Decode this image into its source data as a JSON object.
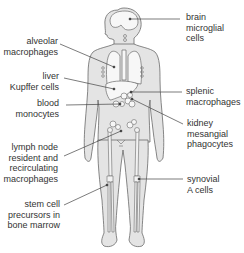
{
  "diagram": {
    "title": "",
    "colors": {
      "body_fill": "#e4e4e4",
      "outline": "#6a6a6a",
      "organ_fill": "#f7f7f7",
      "leader": "#444444",
      "text": "#333333"
    },
    "labels": {
      "brain_line1": "brain",
      "brain_line2": "microglial cells",
      "alveolar_line1": "alveolar",
      "alveolar_line2": "macrophages",
      "liver_line1": "liver",
      "liver_line2": "Kupffer cells",
      "blood_line1": "blood",
      "blood_line2": "monocytes",
      "splenic_line1": "splenic",
      "splenic_line2": "macrophages",
      "kidney_line1": "kidney",
      "kidney_line2": "mesangial",
      "kidney_line3": "phagocytes",
      "lymph_line1": "lymph node",
      "lymph_line2": "resident and",
      "lymph_line3": "recirculating",
      "lymph_line4": "macrophages",
      "synovial_line1": "synovial",
      "synovial_line2": "A cells",
      "stem_line1": "stem cell",
      "stem_line2": "precursors in",
      "stem_line3": "bone marrow"
    }
  }
}
